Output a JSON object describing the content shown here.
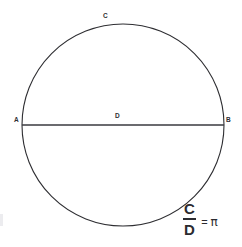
{
  "figure": {
    "background_color": "#ffffff",
    "stroke_color": "#2e2e32",
    "text_color": "#2b2b30",
    "width": 242,
    "height": 247
  },
  "circle": {
    "name": "circle-outline",
    "center_x": 123,
    "center_y": 125,
    "radius": 101,
    "stroke_width": 1.1
  },
  "diameter": {
    "name": "diameter-line",
    "x1": 22,
    "y1": 125,
    "x2": 224,
    "y2": 125,
    "stroke_width": 1.6
  },
  "labels": {
    "a": "A",
    "b": "B",
    "c": "C",
    "d": "D"
  },
  "formula": {
    "numerator": "C",
    "denominator": "D",
    "equals": "=",
    "result": "π"
  },
  "chart_data": {
    "type": "diagram",
    "elements": [
      {
        "kind": "circle",
        "label": "C",
        "meaning": "circumference",
        "center": [
          123,
          125
        ],
        "radius": 101
      },
      {
        "kind": "segment",
        "label": "D",
        "meaning": "diameter",
        "from": "A",
        "to": "B",
        "endpoints": [
          [
            22,
            125
          ],
          [
            224,
            125
          ]
        ]
      },
      {
        "kind": "point",
        "label": "A",
        "position": [
          22,
          125
        ]
      },
      {
        "kind": "point",
        "label": "B",
        "position": [
          224,
          125
        ]
      },
      {
        "kind": "point",
        "label": "C",
        "position": [
          115,
          24
        ]
      },
      {
        "kind": "point",
        "label": "D",
        "position": [
          123,
          125
        ]
      }
    ],
    "equation": "C / D = π",
    "annotations": [
      "C",
      "D",
      "A",
      "B",
      "π"
    ]
  }
}
